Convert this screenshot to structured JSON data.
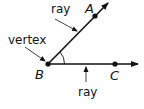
{
  "diagram": {
    "points": {
      "A": {
        "label": "A",
        "x": 95,
        "y": 15
      },
      "B": {
        "label": "B",
        "x": 48,
        "y": 64
      },
      "C": {
        "label": "C",
        "x": 115,
        "y": 64
      }
    },
    "rays": [
      {
        "from": "B",
        "through": "A",
        "tip": [
          109,
          2
        ]
      },
      {
        "from": "B",
        "through": "C",
        "tip": [
          139,
          64
        ]
      }
    ],
    "annotations": {
      "ray_top": "ray",
      "vertex": "vertex",
      "ray_bottom": "ray"
    },
    "colors": {
      "stroke": "#111111",
      "background": "#ffffff"
    }
  }
}
